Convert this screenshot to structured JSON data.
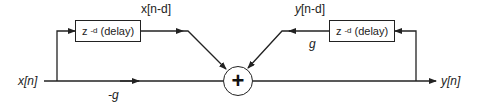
{
  "diagram": {
    "type": "comb-filter block diagram (allpass)",
    "input_label": {
      "var": "x",
      "index": "n"
    },
    "output_label": {
      "var": "y",
      "index": "n"
    },
    "feedforward_delay_box": {
      "main": "z",
      "exponent": "-d",
      "suffix": "(delay)"
    },
    "feedback_delay_box": {
      "main": "z",
      "exponent": "-d",
      "suffix": "(delay)"
    },
    "feedforward_delayed_label": "x[n-d]",
    "feedback_delayed_label_var": "y",
    "feedback_delayed_label_rest": "[n-d]",
    "direct_path_gain": "-g",
    "feedback_gain": "g",
    "summing_node_symbol": "+",
    "colors": {
      "line": "#222222",
      "background": "#ffffff"
    }
  }
}
